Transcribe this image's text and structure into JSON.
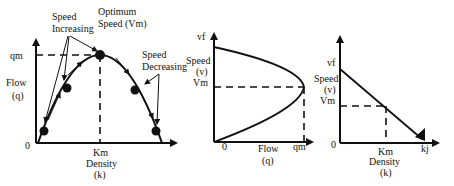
{
  "diagrams": [
    {
      "id": "flow-density",
      "y_label": [
        "Flow",
        "(q)"
      ],
      "x_label": [
        "Km",
        "Density",
        "(k)"
      ],
      "origin": "0",
      "y_tick": "qm",
      "annotations": {
        "optimum": [
          "Optimum",
          "Speed (Vm)"
        ],
        "increasing": [
          "Speed",
          "Increasing"
        ],
        "decreasing": [
          "Speed",
          "Decreasing"
        ]
      }
    },
    {
      "id": "speed-flow",
      "y_top": "vf",
      "y_label": [
        "Speed",
        "(v)"
      ],
      "y_tick": "Vm",
      "origin": "0",
      "x_label": [
        "Flow",
        "(q)"
      ],
      "x_tick": "qm"
    },
    {
      "id": "speed-density",
      "y_top": "vf",
      "y_label": [
        "Speed",
        "(v)"
      ],
      "y_tick": "Vm",
      "origin": "0",
      "x_label": [
        "Km",
        "Density",
        "(k)"
      ],
      "x_end": "kj"
    }
  ],
  "colors": {
    "line": "#111111",
    "background": "#ffffff"
  }
}
